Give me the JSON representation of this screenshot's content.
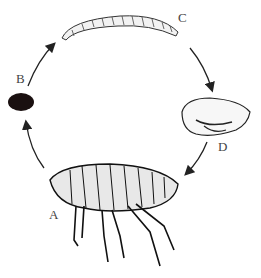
{
  "diagram": {
    "stages": [
      {
        "label": "A",
        "stage": "adult"
      },
      {
        "label": "B",
        "stage": "egg"
      },
      {
        "label": "C",
        "stage": "larva"
      },
      {
        "label": "D",
        "stage": "pupa"
      }
    ],
    "cycle_order": [
      "B",
      "C",
      "D",
      "A"
    ]
  }
}
